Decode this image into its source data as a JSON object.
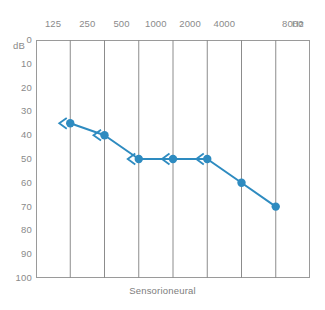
{
  "chart_data": {
    "type": "line",
    "title": "",
    "caption": "Sensorioneural",
    "xlabel": "Hz",
    "ylabel": "dB",
    "x_unit_label": "Hz",
    "y_unit_label": "dB",
    "frequency_ticks": [
      "125",
      "250",
      "500",
      "1000",
      "2000",
      "4000",
      "8000"
    ],
    "db_ticks": [
      "0",
      "10",
      "20",
      "30",
      "40",
      "50",
      "60",
      "70",
      "80",
      "90",
      "100"
    ],
    "ylim": [
      0,
      100
    ],
    "y_inverted": true,
    "grid": true,
    "legend": "none",
    "series": [
      {
        "name": "Left ear bone conduction (masked)",
        "color": "#2E8BC0",
        "points": [
          {
            "frequency": "250",
            "db": 35,
            "marker": "circle-with-left-arrow"
          },
          {
            "frequency": "500",
            "db": 40,
            "marker": "circle-with-left-arrow"
          },
          {
            "frequency": "1000",
            "db": 50,
            "marker": "circle-with-left-arrow"
          },
          {
            "frequency": "2000",
            "db": 50,
            "marker": "circle-with-left-arrow"
          },
          {
            "frequency": "4000",
            "db": 50,
            "marker": "circle-with-left-arrow"
          },
          {
            "frequency": "6000",
            "db": 60,
            "marker": "circle"
          },
          {
            "frequency": "8000",
            "db": 70,
            "marker": "circle"
          }
        ]
      }
    ]
  },
  "colors": {
    "series": "#2E8BC0",
    "grid": "#8c8c8c",
    "frame": "#9a9a9a",
    "axis_text": "#8a8a8a",
    "caption_text": "#7d7d7d",
    "background": "#ffffff"
  }
}
